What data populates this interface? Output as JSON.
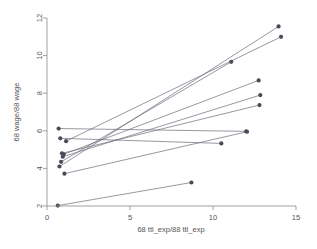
{
  "chart_data": {
    "type": "line",
    "title": "",
    "xlabel": "68 ttl_exp/88 ttl_exp",
    "ylabel": "68 wage/88 wage",
    "xlim": [
      0,
      15
    ],
    "ylim": [
      2,
      12
    ],
    "xticks": [
      0,
      5,
      10,
      15
    ],
    "xtick_labels": [
      "0",
      "5",
      "10",
      "15"
    ],
    "yticks": [
      2,
      4,
      6,
      8,
      10,
      12
    ],
    "ytick_labels": [
      "2",
      "4",
      "6",
      "8",
      "10",
      "12"
    ],
    "grid": false,
    "legend": "none",
    "marker": "filled-circle",
    "series": [
      {
        "name": "pair-1",
        "x": [
          0.75,
          13.95
        ],
        "y": [
          4.1,
          11.55
        ]
      },
      {
        "name": "pair-2",
        "x": [
          1.15,
          14.1
        ],
        "y": [
          5.45,
          11.0
        ]
      },
      {
        "name": "pair-3",
        "x": [
          0.85,
          11.1
        ],
        "y": [
          4.35,
          9.67
        ]
      },
      {
        "name": "pair-4",
        "x": [
          1.0,
          12.75
        ],
        "y": [
          4.75,
          8.68
        ]
      },
      {
        "name": "pair-5",
        "x": [
          0.95,
          12.85
        ],
        "y": [
          4.62,
          7.9
        ]
      },
      {
        "name": "pair-6",
        "x": [
          0.9,
          12.8
        ],
        "y": [
          4.8,
          7.37
        ]
      },
      {
        "name": "pair-7",
        "x": [
          0.7,
          12.0
        ],
        "y": [
          6.12,
          5.97
        ]
      },
      {
        "name": "pair-8",
        "x": [
          0.8,
          10.5
        ],
        "y": [
          5.6,
          5.33
        ]
      },
      {
        "name": "pair-9",
        "x": [
          1.05,
          12.05
        ],
        "y": [
          3.72,
          5.95
        ]
      },
      {
        "name": "pair-10",
        "x": [
          0.65,
          8.7
        ],
        "y": [
          2.02,
          3.25
        ]
      }
    ]
  },
  "axes": {
    "x_axis_title": "68 ttl_exp/88 ttl_exp",
    "y_axis_title": "68 wage/88 wage"
  }
}
